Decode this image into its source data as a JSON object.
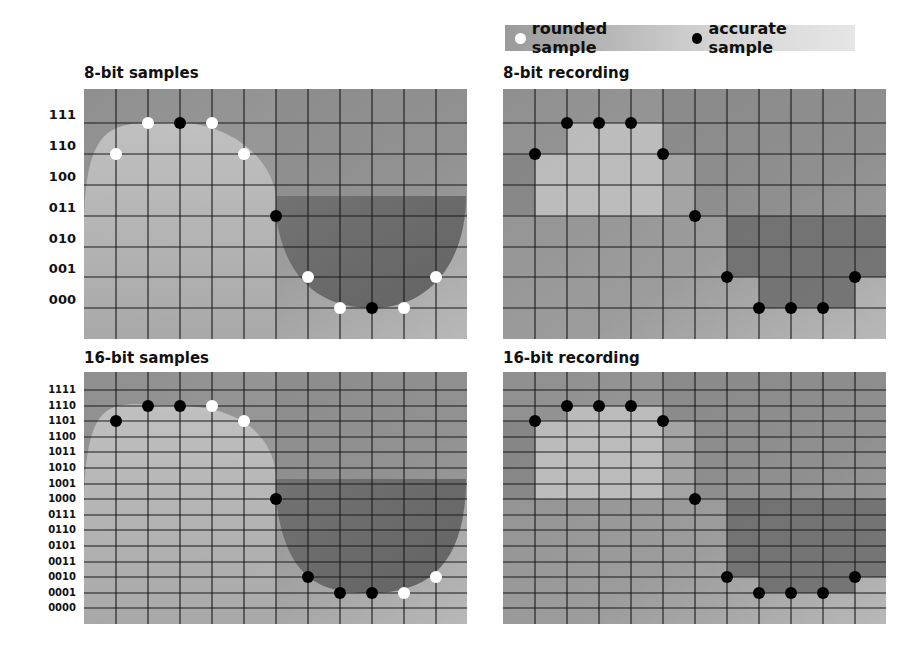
{
  "legend": {
    "rounded_label": "rounded sample",
    "accurate_label": "accurate sample",
    "rounded_color": "#ffffff",
    "accurate_color": "#000000"
  },
  "panels": {
    "tl": {
      "title": "8-bit samples"
    },
    "tr": {
      "title": "8-bit recording"
    },
    "bl": {
      "title": "16-bit samples"
    },
    "br": {
      "title": "16-bit recording"
    }
  },
  "y_labels_8": [
    "111",
    "110",
    "100",
    "011",
    "010",
    "001",
    "000"
  ],
  "y_labels_16": [
    "1111",
    "1110",
    "1101",
    "1100",
    "1011",
    "1010",
    "1001",
    "1000",
    "0111",
    "0110",
    "0101",
    "0011",
    "0010",
    "0001",
    "0000"
  ],
  "chart_data": [
    {
      "type": "scatter",
      "title": "8-bit samples",
      "levels": [
        "000",
        "001",
        "010",
        "011",
        "100",
        "110",
        "111"
      ],
      "x": [
        1,
        2,
        3,
        4,
        5,
        6,
        7,
        8,
        9,
        10,
        11
      ],
      "sample_level_index_from_top": [
        1,
        0,
        0,
        0,
        1,
        3,
        5,
        6,
        6,
        6,
        5
      ],
      "sample_type": [
        "rounded",
        "rounded",
        "accurate",
        "rounded",
        "rounded",
        "accurate",
        "rounded",
        "rounded",
        "accurate",
        "rounded",
        "rounded"
      ]
    },
    {
      "type": "line",
      "title": "8-bit recording",
      "x": [
        1,
        2,
        3,
        4,
        5,
        6,
        7,
        8,
        9,
        10,
        11
      ],
      "sample_level_index_from_top": [
        1,
        0,
        0,
        0,
        1,
        3,
        5,
        6,
        6,
        6,
        5
      ],
      "sample_type": "accurate"
    },
    {
      "type": "scatter",
      "title": "16-bit samples",
      "levels": [
        "0000",
        "0001",
        "0010",
        "0011",
        "0101",
        "0110",
        "0111",
        "1000",
        "1001",
        "1010",
        "1011",
        "1100",
        "1101",
        "1110",
        "1111"
      ],
      "x": [
        1,
        2,
        3,
        4,
        5,
        6,
        7,
        8,
        9,
        10,
        11
      ],
      "sample_level_index_from_top": [
        2,
        1,
        1,
        1,
        2,
        7,
        12,
        13,
        13,
        13,
        12
      ],
      "sample_type": [
        "accurate",
        "accurate",
        "accurate",
        "rounded",
        "rounded",
        "accurate",
        "accurate",
        "accurate",
        "accurate",
        "rounded",
        "rounded"
      ]
    },
    {
      "type": "line",
      "title": "16-bit recording",
      "x": [
        1,
        2,
        3,
        4,
        5,
        6,
        7,
        8,
        9,
        10,
        11
      ],
      "sample_level_index_from_top": [
        2,
        1,
        1,
        1,
        2,
        7,
        12,
        13,
        13,
        13,
        12
      ],
      "sample_type": "accurate"
    }
  ]
}
